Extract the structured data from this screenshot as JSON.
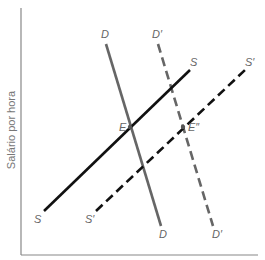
{
  "diagram": {
    "type": "supply-demand",
    "y_axis_label": "Salário por hora",
    "x_axis_label": "",
    "colors": {
      "axis": "#888888",
      "demand": "#666666",
      "supply": "#111111",
      "label": "#666666"
    },
    "curves": [
      {
        "id": "D",
        "kind": "demand",
        "style": "solid",
        "top_label": "D",
        "bottom_label": "D"
      },
      {
        "id": "D_prime",
        "kind": "demand",
        "style": "dashed",
        "top_label": "D′",
        "bottom_label": "D′"
      },
      {
        "id": "S",
        "kind": "supply",
        "style": "solid",
        "top_label": "S",
        "bottom_label": "S"
      },
      {
        "id": "S_prime",
        "kind": "supply",
        "style": "dashed",
        "top_label": "S′",
        "bottom_label": "S′"
      }
    ],
    "points": [
      {
        "id": "E",
        "label": "E",
        "intersection": [
          "S",
          "D"
        ]
      },
      {
        "id": "E_double_prime",
        "label": "E″",
        "intersection": [
          "S_prime",
          "D_prime"
        ]
      }
    ]
  }
}
